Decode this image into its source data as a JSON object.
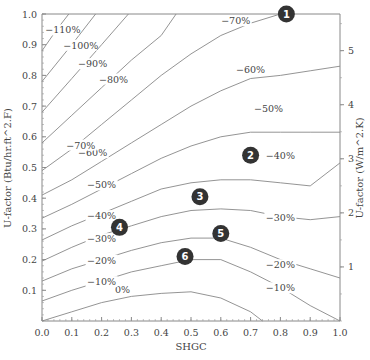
{
  "chart_data": {
    "type": "line",
    "title": "",
    "xlabel": "SHGC",
    "ylabel": "U-factor (Btu/hr.ft^2.F)",
    "y2label": "U-factor (W/m^2.K)",
    "xlim": [
      0,
      1.0
    ],
    "ylim": [
      0,
      1.0
    ],
    "y2lim": [
      0,
      5.678
    ],
    "x_ticks": [
      "0.0",
      "0.1",
      "0.2",
      "0.3",
      "0.4",
      "0.5",
      "0.6",
      "0.7",
      "0.8",
      "0.9",
      "1.0"
    ],
    "y_ticks": [
      "0.1",
      "0.2",
      "0.3",
      "0.4",
      "0.5",
      "0.6",
      "0.7",
      "0.8",
      "0.9",
      "1.0"
    ],
    "y2_ticks": [
      "1",
      "2",
      "3",
      "4",
      "5"
    ],
    "grid": false,
    "series": [
      {
        "name": "0%",
        "label": "0%",
        "label_at": [
          0.27,
          0.095
        ],
        "points": [
          [
            0,
            0.0
          ],
          [
            0.1,
            0.03
          ],
          [
            0.2,
            0.06
          ],
          [
            0.3,
            0.08
          ],
          [
            0.4,
            0.09
          ],
          [
            0.5,
            0.095
          ],
          [
            0.6,
            0.075
          ],
          [
            0.7,
            0.03
          ],
          [
            0.74,
            0.0
          ]
        ]
      },
      {
        "name": "-10%",
        "label": "−10%",
        "label_at": [
          0.2,
          0.12
        ],
        "label2": "−10%",
        "label2_at": [
          0.8,
          0.1
        ],
        "points": [
          [
            0,
            0.065
          ],
          [
            0.1,
            0.1
          ],
          [
            0.2,
            0.13
          ],
          [
            0.3,
            0.16
          ],
          [
            0.4,
            0.18
          ],
          [
            0.5,
            0.2
          ],
          [
            0.6,
            0.2
          ],
          [
            0.7,
            0.16
          ],
          [
            0.8,
            0.11
          ],
          [
            0.9,
            0.05
          ],
          [
            1.0,
            0.0
          ]
        ]
      },
      {
        "name": "-20%",
        "label": "−20%",
        "label_at": [
          0.2,
          0.19
        ],
        "label2": "−20%",
        "label2_at": [
          0.8,
          0.175
        ],
        "points": [
          [
            0,
            0.13
          ],
          [
            0.1,
            0.17
          ],
          [
            0.2,
            0.2
          ],
          [
            0.3,
            0.23
          ],
          [
            0.4,
            0.255
          ],
          [
            0.5,
            0.27
          ],
          [
            0.6,
            0.27
          ],
          [
            0.7,
            0.24
          ],
          [
            0.8,
            0.2
          ],
          [
            0.9,
            0.17
          ],
          [
            1.0,
            0.14
          ]
        ]
      },
      {
        "name": "-30%",
        "label": "−30%",
        "label_at": [
          0.2,
          0.26
        ],
        "label2": "−30%",
        "label2_at": [
          0.8,
          0.33
        ],
        "points": [
          [
            0,
            0.195
          ],
          [
            0.1,
            0.24
          ],
          [
            0.2,
            0.28
          ],
          [
            0.3,
            0.31
          ],
          [
            0.4,
            0.34
          ],
          [
            0.5,
            0.36
          ],
          [
            0.6,
            0.365
          ],
          [
            0.7,
            0.36
          ],
          [
            0.8,
            0.34
          ],
          [
            0.9,
            0.33
          ],
          [
            1.0,
            0.34
          ]
        ]
      },
      {
        "name": "-40%",
        "label": "−40%",
        "label_at": [
          0.2,
          0.335
        ],
        "label2": "−40%",
        "label2_at": [
          0.8,
          0.53
        ],
        "points": [
          [
            0,
            0.264
          ],
          [
            0.1,
            0.31
          ],
          [
            0.2,
            0.35
          ],
          [
            0.3,
            0.39
          ],
          [
            0.4,
            0.43
          ],
          [
            0.5,
            0.45
          ],
          [
            0.6,
            0.46
          ],
          [
            0.7,
            0.46
          ],
          [
            0.8,
            0.45
          ],
          [
            0.9,
            0.44
          ],
          [
            1.0,
            0.515
          ]
        ]
      },
      {
        "name": "-50%",
        "label": "−50%",
        "label_at": [
          0.2,
          0.435
        ],
        "label2": "−50%",
        "label2_at": [
          0.76,
          0.685
        ],
        "points": [
          [
            0,
            0.335
          ],
          [
            0.1,
            0.38
          ],
          [
            0.2,
            0.43
          ],
          [
            0.3,
            0.48
          ],
          [
            0.4,
            0.53
          ],
          [
            0.5,
            0.57
          ],
          [
            0.6,
            0.6
          ],
          [
            0.7,
            0.615
          ],
          [
            0.8,
            0.615
          ],
          [
            0.9,
            0.615
          ],
          [
            1.0,
            0.615
          ]
        ]
      },
      {
        "name": "-60%",
        "label": "−60%",
        "label_at": [
          0.17,
          0.54
        ],
        "label2": "−60%",
        "label2_at": [
          0.7,
          0.81
        ],
        "points": [
          [
            0,
            0.41
          ],
          [
            0.1,
            0.46
          ],
          [
            0.2,
            0.52
          ],
          [
            0.3,
            0.58
          ],
          [
            0.4,
            0.64
          ],
          [
            0.5,
            0.7
          ],
          [
            0.6,
            0.75
          ],
          [
            0.7,
            0.79
          ],
          [
            0.8,
            0.8
          ],
          [
            0.9,
            0.815
          ],
          [
            1.0,
            0.83
          ]
        ]
      },
      {
        "name": "-70%",
        "label": "−70%",
        "label_at": [
          0.13,
          0.565
        ],
        "label2": "−70%",
        "label2_at": [
          0.65,
          0.97
        ],
        "points": [
          [
            0,
            0.49
          ],
          [
            0.1,
            0.56
          ],
          [
            0.2,
            0.64
          ],
          [
            0.3,
            0.72
          ],
          [
            0.4,
            0.8
          ],
          [
            0.5,
            0.87
          ],
          [
            0.6,
            0.93
          ],
          [
            0.7,
            0.97
          ],
          [
            0.8,
            1.0
          ]
        ]
      },
      {
        "name": "-80%",
        "label": "−80%",
        "label_at": [
          0.24,
          0.78
        ],
        "points": [
          [
            0,
            0.58
          ],
          [
            0.1,
            0.67
          ],
          [
            0.2,
            0.76
          ],
          [
            0.3,
            0.85
          ],
          [
            0.4,
            0.93
          ],
          [
            0.45,
            1.0
          ]
        ]
      },
      {
        "name": "-90%",
        "label": "−90%",
        "label_at": [
          0.17,
          0.83
        ],
        "points": [
          [
            0,
            0.68
          ],
          [
            0.1,
            0.79
          ],
          [
            0.2,
            0.9
          ],
          [
            0.29,
            1.0
          ]
        ]
      },
      {
        "name": "-100%",
        "label": "−100%",
        "label_at": [
          0.13,
          0.89
        ],
        "points": [
          [
            0,
            0.78
          ],
          [
            0.1,
            0.9
          ],
          [
            0.18,
            1.0
          ]
        ]
      },
      {
        "name": "-110%",
        "label": "−110%",
        "label_at": [
          0.07,
          0.94
        ],
        "points": [
          [
            0,
            0.88
          ],
          [
            0.05,
            0.95
          ],
          [
            0.09,
            1.0
          ]
        ]
      }
    ],
    "annotations": [
      {
        "label": "1",
        "x": 0.82,
        "y": 1.0
      },
      {
        "label": "2",
        "x": 0.7,
        "y": 0.54
      },
      {
        "label": "3",
        "x": 0.53,
        "y": 0.405
      },
      {
        "label": "4",
        "x": 0.26,
        "y": 0.305
      },
      {
        "label": "5",
        "x": 0.6,
        "y": 0.285
      },
      {
        "label": "6",
        "x": 0.48,
        "y": 0.21
      }
    ]
  }
}
